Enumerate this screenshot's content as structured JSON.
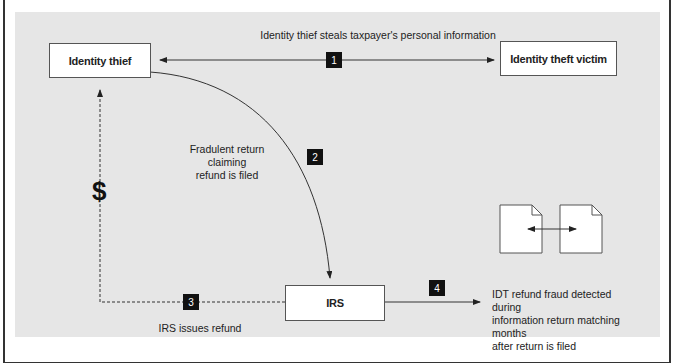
{
  "nodes": {
    "identity_thief": "Identity thief",
    "identity_theft_victim": "Identity theft victim",
    "irs": "IRS"
  },
  "steps": [
    {
      "number": "1",
      "label": "Identity thief steals taxpayer's personal information"
    },
    {
      "number": "2",
      "label_line1": "Fradulent return claiming",
      "label_line2": "refund is filed"
    },
    {
      "number": "3",
      "label": "IRS issues refund"
    },
    {
      "number": "4",
      "label_line1": "IDT refund fraud detected during",
      "label_line2": "information return matching months",
      "label_line3": "after return is filed"
    }
  ],
  "money_symbol": "$",
  "colors": {
    "panel": "#e6e6e6",
    "box": "#ffffff",
    "badge": "#111111",
    "line": "#333333"
  }
}
